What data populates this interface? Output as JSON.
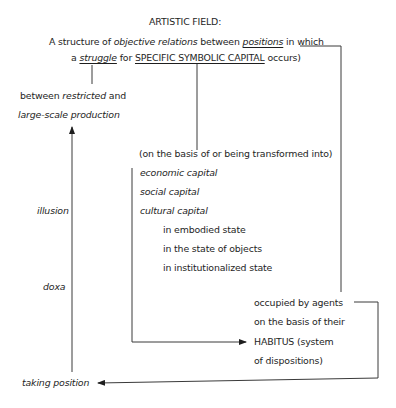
{
  "title": "ARTISTIC FIELD:",
  "definition": {
    "line1": {
      "a": "A structure of ",
      "b": "objective relations",
      "c": " between ",
      "d": "positions",
      "e": " in which"
    },
    "line2": {
      "a": "a ",
      "b": "struggle",
      "c": " for ",
      "d": "SPECIFIC SYMBOLIC CAPITAL",
      "e": " occurs)"
    }
  },
  "struggle_branch": {
    "line1_a": "between ",
    "line1_b": "restricted",
    "line1_c": " and",
    "line2": "large-scale production"
  },
  "capital_branch": {
    "intro": "(on the basis of or being transformed into)",
    "types": [
      "economic capital",
      "social capital",
      "cultural capital"
    ],
    "cultural_states": [
      "in embodied state",
      "in the state of objects",
      "in institutionalized state"
    ]
  },
  "agents_branch": {
    "lines": [
      "occupied by agents",
      "on the basis of their",
      "HABITUS (system",
      "of dispositions)"
    ]
  },
  "left_axis": {
    "label_upper": "illusion",
    "label_lower": "doxa",
    "bottom": "taking position"
  },
  "colors": {
    "line": "#3a3a3a",
    "text": "#1e1e1e",
    "background": "#ffffff"
  }
}
